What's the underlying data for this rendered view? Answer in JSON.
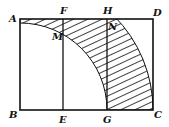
{
  "figure": {
    "type": "geometry",
    "labels": {
      "A": "A",
      "B": "B",
      "C": "C",
      "D": "D",
      "E": "E",
      "F": "F",
      "G": "G",
      "H": "H",
      "M": "M",
      "N": "N"
    },
    "shaded_region": "annular sector between arcs centered at B, hatched",
    "line_color": "#111111"
  }
}
